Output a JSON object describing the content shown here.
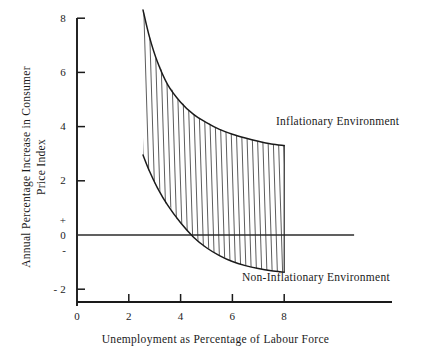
{
  "chart_data": {
    "type": "line",
    "title": "",
    "xlabel": "Unemployment as Percentage of Labour Force",
    "ylabel_line1": "Annual Percentage Increase in Consumer",
    "ylabel_line2": "Price Index",
    "xlim": [
      0,
      10
    ],
    "ylim": [
      -3,
      8.3
    ],
    "grid": false,
    "legend_position": "inline-annotations",
    "xticks": [
      {
        "value": 0,
        "label": "0"
      },
      {
        "value": 2,
        "label": "2"
      },
      {
        "value": 4,
        "label": "4"
      },
      {
        "value": 6,
        "label": "6"
      },
      {
        "value": 8,
        "label": "8"
      }
    ],
    "yticks": [
      {
        "value": 8,
        "label": "8"
      },
      {
        "value": 6,
        "label": "6"
      },
      {
        "value": 4,
        "label": "4"
      },
      {
        "value": 2,
        "label": "2"
      },
      {
        "value": 0,
        "label": "0"
      },
      {
        "value": -2,
        "label": "- 2"
      }
    ],
    "y_sign_positive": "+",
    "y_sign_negative": "-",
    "zero_line": {
      "y": 0,
      "x_from": 0,
      "x_to": 10.7
    },
    "series": [
      {
        "name": "Inflationary Environment",
        "annotation": "Inflationary Environment",
        "x": [
          2.55,
          2.8,
          3.1,
          3.5,
          4.0,
          4.5,
          5.0,
          5.5,
          6.0,
          6.5,
          7.0,
          7.5,
          8.0
        ],
        "y": [
          8.3,
          7.3,
          6.4,
          5.55,
          4.9,
          4.45,
          4.15,
          3.9,
          3.72,
          3.58,
          3.46,
          3.36,
          3.3
        ]
      },
      {
        "name": "Non-Inflationary Environment",
        "annotation": "Non-Inflationary Environment",
        "x": [
          2.55,
          2.8,
          3.1,
          3.5,
          4.0,
          4.5,
          5.0,
          5.5,
          6.0,
          6.5,
          7.0,
          7.5,
          8.0
        ],
        "y": [
          2.95,
          2.35,
          1.75,
          1.1,
          0.45,
          -0.08,
          -0.47,
          -0.76,
          -0.98,
          -1.13,
          -1.24,
          -1.32,
          -1.37
        ]
      }
    ],
    "shaded_band": {
      "description": "Hatched region between the Inflationary and Non-Inflationary curves",
      "hatch_style": "near-vertical lines",
      "hatch_count": 28,
      "x_from": 2.55,
      "x_to": 8.0
    },
    "colors": {
      "ink": "#1a1a1a",
      "hatch": "#4a4a4a",
      "background": "#ffffff"
    }
  }
}
